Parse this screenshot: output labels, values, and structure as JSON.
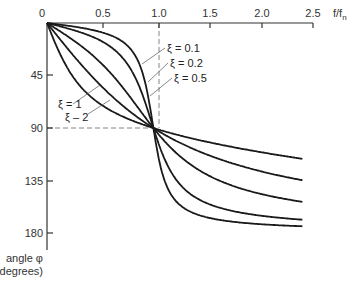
{
  "chart_data": {
    "type": "line",
    "title": "",
    "xlabel": "f/f_n",
    "ylabel": "angle φ (degrees)",
    "x_ticks": [
      "0",
      "0.5",
      "1.0",
      "1.5",
      "2.0",
      "2.5"
    ],
    "y_ticks": [
      "0",
      "45",
      "90",
      "135",
      "180"
    ],
    "xlim": [
      0,
      2.5
    ],
    "ylim": [
      0,
      180
    ],
    "y_inverted": true,
    "x_axis_position": "top",
    "grid": false,
    "guides": [
      {
        "type": "vertical",
        "x": 1.0,
        "style": "dashed"
      },
      {
        "type": "horizontal",
        "y": 90,
        "style": "dashed"
      }
    ],
    "series": [
      {
        "name": "ξ = 0.1",
        "damping": 0.1,
        "x": [
          0,
          0.5,
          0.8,
          0.9,
          1.0,
          1.1,
          1.2,
          1.5,
          2.0,
          2.4
        ],
        "values": [
          0,
          7.6,
          24,
          43.5,
          90,
          133.7,
          168.1,
          173.1,
          176.2,
          177.0
        ]
      },
      {
        "name": "ξ = 0.2",
        "damping": 0.2,
        "x": [
          0,
          0.5,
          0.8,
          0.9,
          1.0,
          1.1,
          1.2,
          1.5,
          2.0,
          2.4
        ],
        "values": [
          0,
          14.9,
          41.6,
          62.2,
          90,
          115.5,
          132.1,
          166.2,
          172.4,
          174.1
        ]
      },
      {
        "name": "ξ = 0.5",
        "damping": 0.5,
        "x": [
          0,
          0.5,
          0.8,
          0.9,
          1.0,
          1.1,
          1.2,
          1.5,
          2.0,
          2.4
        ],
        "values": [
          0,
          33.7,
          65.8,
          78.1,
          90,
          100.0,
          114.2,
          129.8,
          146.3,
          153.2
        ]
      },
      {
        "name": "ξ = 1",
        "damping": 1.0,
        "x": [
          0,
          0.5,
          0.8,
          0.9,
          1.0,
          1.1,
          1.2,
          1.5,
          2.0,
          2.4
        ],
        "values": [
          0,
          53.1,
          77.3,
          83.9,
          90,
          95.4,
          100.4,
          112.6,
          126.9,
          135.3
        ]
      },
      {
        "name": "ξ = 2",
        "damping": 2.0,
        "x": [
          0,
          0.5,
          0.8,
          0.9,
          1.0,
          1.1,
          1.2,
          1.5,
          2.0,
          2.4
        ],
        "values": [
          0,
          69.4,
          83.6,
          86.9,
          90,
          92.7,
          95.2,
          101.4,
          110.6,
          116.4
        ]
      }
    ],
    "labels": {
      "xi_01": "ξ = 0.1",
      "xi_02": "ξ = 0.2",
      "xi_05": "ξ = 0.5",
      "xi_1": "ξ = 1",
      "xi_2": "ξ – 2"
    },
    "x_axis_label": "f/f",
    "x_axis_label_sub": "n",
    "y_axis_label_line1": "angle φ",
    "y_axis_label_line2": "(degrees)"
  }
}
